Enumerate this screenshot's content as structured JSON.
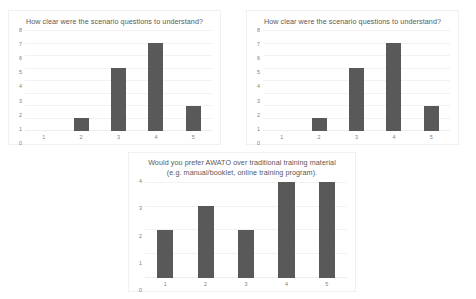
{
  "charts": [
    {
      "id": "chart-top-left",
      "title": "How clear were the scenario questions to understand?"
    },
    {
      "id": "chart-top-right",
      "title": "How clear were the scenario questions to understand?"
    },
    {
      "id": "chart-bottom",
      "title": "Would you prefer AWATO over traditional training material (e.g. manual/booklet, online training program)."
    }
  ],
  "colors": {
    "bar": "#595959",
    "gridline": "#f2f2f2",
    "axis_text": "#808080",
    "title_text": "#595959",
    "panel_border": "#f0f0f0",
    "background": "#ffffff"
  },
  "chart_data": [
    {
      "type": "bar",
      "title": "How clear were the scenario questions to understand?",
      "categories": [
        "1",
        "2",
        "3",
        "4",
        "5"
      ],
      "values": [
        0,
        1,
        5,
        7,
        2
      ],
      "xlabel": "",
      "ylabel": "",
      "ylim": [
        0,
        8
      ],
      "yticks": [
        0,
        1,
        2,
        3,
        4,
        5,
        6,
        7,
        8
      ],
      "ytick_labels": [
        "8",
        "7",
        "6",
        "5",
        "4",
        "3",
        "2",
        "1",
        "0"
      ],
      "grid": true,
      "legend": false
    },
    {
      "type": "bar",
      "title": "How clear were the scenario questions to understand?",
      "categories": [
        "1",
        "2",
        "3",
        "4",
        "5"
      ],
      "values": [
        0,
        1,
        5,
        7,
        2
      ],
      "xlabel": "",
      "ylabel": "",
      "ylim": [
        0,
        8
      ],
      "yticks": [
        0,
        1,
        2,
        3,
        4,
        5,
        6,
        7,
        8
      ],
      "ytick_labels": [
        "8",
        "7",
        "6",
        "5",
        "4",
        "3",
        "2",
        "1",
        "0"
      ],
      "grid": true,
      "legend": false
    },
    {
      "type": "bar",
      "title": "Would you prefer AWATO over traditional training material (e.g. manual/booklet, online training program).",
      "categories": [
        "1",
        "2",
        "3",
        "4",
        "5"
      ],
      "values": [
        2,
        3,
        2,
        4,
        4
      ],
      "xlabel": "",
      "ylabel": "",
      "ylim": [
        0,
        4
      ],
      "yticks": [
        0,
        1,
        2,
        3,
        4
      ],
      "ytick_labels": [
        "4",
        "3",
        "2",
        "1",
        "0"
      ],
      "grid": true,
      "legend": false
    }
  ]
}
